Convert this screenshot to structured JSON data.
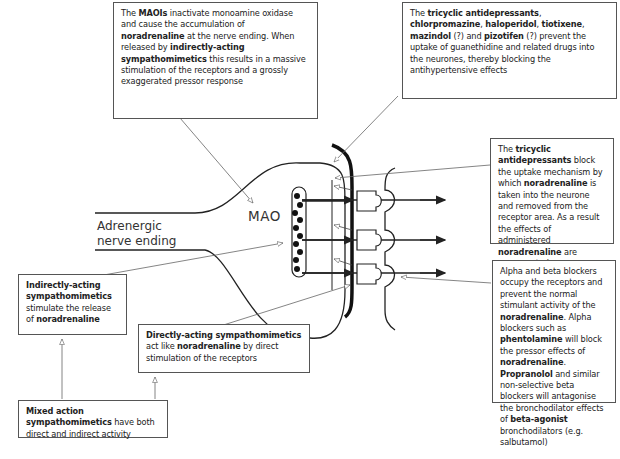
{
  "labels": {
    "nerve_ending": [
      "Adrenergic",
      "nerve ending"
    ],
    "mao": "MAO"
  },
  "boxes": {
    "maois": {
      "segments": [
        {
          "t": "The ",
          "b": false
        },
        {
          "t": "MAOIs",
          "b": true
        },
        {
          "t": " inactivate monoamine oxidase and cause the accumulation of ",
          "b": false
        },
        {
          "t": "noradrenaline",
          "b": true
        },
        {
          "t": " at the nerve ending. When released by ",
          "b": false
        },
        {
          "t": "indirectly-acting sympathomimetics",
          "b": true
        },
        {
          "t": " this results in a massive stimulation of the receptors and a grossly exaggerated pressor response",
          "b": false
        }
      ]
    },
    "tricyclic_guanethidine": {
      "segments": [
        {
          "t": "The ",
          "b": false
        },
        {
          "t": "tricyclic antidepressants",
          "b": true
        },
        {
          "t": ", ",
          "b": false
        },
        {
          "t": "chlorpromazine",
          "b": true
        },
        {
          "t": ", ",
          "b": false
        },
        {
          "t": "haloperidol",
          "b": true
        },
        {
          "t": ", ",
          "b": false
        },
        {
          "t": "tiotixene",
          "b": true
        },
        {
          "t": ", ",
          "b": false
        },
        {
          "t": "mazindol",
          "b": true
        },
        {
          "t": " (?) and ",
          "b": false
        },
        {
          "t": "pizotifen",
          "b": true
        },
        {
          "t": " (?) prevent the uptake of guanethidine and related drugs into the neurones, thereby blocking the antihypertensive effects",
          "b": false
        }
      ]
    },
    "tricyclic_uptake": {
      "segments": [
        {
          "t": "The ",
          "b": false
        },
        {
          "t": "tricyclic antidepressants",
          "b": true
        },
        {
          "t": " block the uptake mechanism by which ",
          "b": false
        },
        {
          "t": "noradrenaline",
          "b": true
        },
        {
          "t": " is taken into the neurone and removed from the receptor area. As a result the effects of administered ",
          "b": false
        },
        {
          "t": "noradrenaline",
          "b": true
        },
        {
          "t": " are exaggerated",
          "b": false
        }
      ]
    },
    "blockers": {
      "segments": [
        {
          "t": "Alpha and beta blockers occupy the receptors and prevent the normal stimulant activity of the ",
          "b": false
        },
        {
          "t": "noradrenaline",
          "b": true
        },
        {
          "t": ". Alpha blockers such as ",
          "b": false
        },
        {
          "t": "phentolamine",
          "b": true
        },
        {
          "t": " will block the pressor effects of ",
          "b": false
        },
        {
          "t": "noradrenaline",
          "b": true
        },
        {
          "t": ". ",
          "b": false
        },
        {
          "t": "Propranolol",
          "b": true
        },
        {
          "t": " and similar non-selective beta blockers will antagonise the bronchodilator effects of ",
          "b": false
        },
        {
          "t": "beta-agonist",
          "b": true
        },
        {
          "t": " bronchodilators (e.g. salbutamol)",
          "b": false
        }
      ]
    },
    "indirect": {
      "segments": [
        {
          "t": "Indirectly-acting sympathomimetics",
          "b": true
        },
        {
          "t": " stimulate the release of ",
          "b": false
        },
        {
          "t": "noradrenaline",
          "b": true
        }
      ]
    },
    "direct": {
      "segments": [
        {
          "t": "Directly-acting sympathomimetics",
          "b": true
        },
        {
          "t": " act like ",
          "b": false
        },
        {
          "t": "noradrenaline",
          "b": true
        },
        {
          "t": " by direct stimulation of the receptors",
          "b": false
        }
      ]
    },
    "mixed": {
      "segments": [
        {
          "t": "Mixed action sympathomimetics",
          "b": true
        },
        {
          "t": " have both direct and indirect activity",
          "b": false
        }
      ]
    }
  },
  "colors": {
    "stroke": "#222222",
    "box_border": "#555555",
    "leader": "#666666"
  }
}
